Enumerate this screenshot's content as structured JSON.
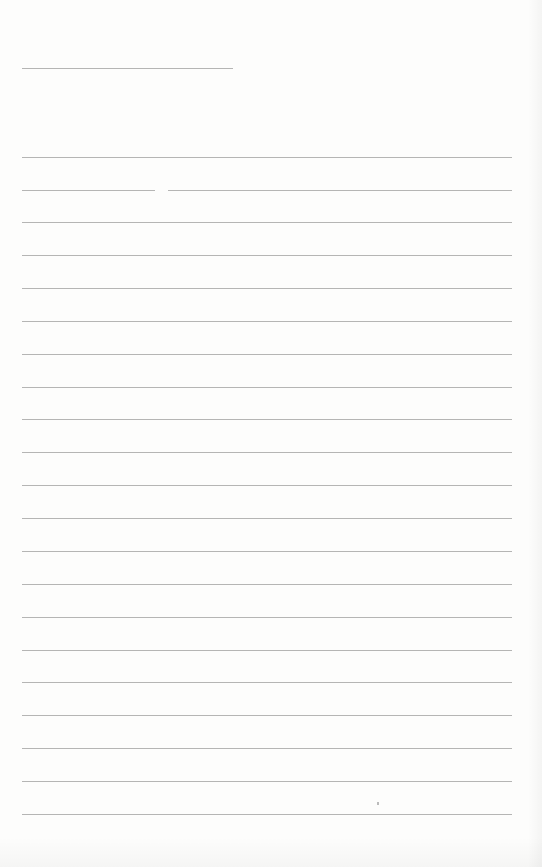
{
  "page": {
    "type": "blank lined sheet",
    "background": "#fdfdfc",
    "line_color": "#9c9c9c",
    "header_line": {
      "x": 22,
      "y": 68,
      "width": 211
    },
    "lines": [
      {
        "y": 157,
        "segments": [
          [
            22,
            512
          ]
        ]
      },
      {
        "y": 190,
        "segments": [
          [
            22,
            155
          ],
          [
            168,
            512
          ]
        ]
      },
      {
        "y": 222,
        "segments": [
          [
            22,
            512
          ]
        ]
      },
      {
        "y": 255,
        "segments": [
          [
            22,
            512
          ]
        ]
      },
      {
        "y": 288,
        "segments": [
          [
            22,
            512
          ]
        ]
      },
      {
        "y": 321,
        "segments": [
          [
            22,
            512
          ]
        ]
      },
      {
        "y": 354,
        "segments": [
          [
            22,
            512
          ]
        ]
      },
      {
        "y": 387,
        "segments": [
          [
            22,
            512
          ]
        ]
      },
      {
        "y": 419,
        "segments": [
          [
            22,
            512
          ]
        ]
      },
      {
        "y": 452,
        "segments": [
          [
            22,
            512
          ]
        ]
      },
      {
        "y": 485,
        "segments": [
          [
            22,
            512
          ]
        ]
      },
      {
        "y": 518,
        "segments": [
          [
            22,
            512
          ]
        ]
      },
      {
        "y": 551,
        "segments": [
          [
            22,
            512
          ]
        ]
      },
      {
        "y": 584,
        "segments": [
          [
            22,
            512
          ]
        ]
      },
      {
        "y": 617,
        "segments": [
          [
            22,
            512
          ]
        ]
      },
      {
        "y": 650,
        "segments": [
          [
            22,
            512
          ]
        ]
      },
      {
        "y": 682,
        "segments": [
          [
            22,
            512
          ]
        ]
      },
      {
        "y": 715,
        "segments": [
          [
            22,
            512
          ]
        ]
      },
      {
        "y": 748,
        "segments": [
          [
            22,
            512
          ]
        ]
      },
      {
        "y": 781,
        "segments": [
          [
            22,
            512
          ]
        ]
      },
      {
        "y": 814,
        "segments": [
          [
            22,
            512
          ]
        ]
      }
    ],
    "stray_mark": {
      "x": 377,
      "y": 802
    }
  }
}
